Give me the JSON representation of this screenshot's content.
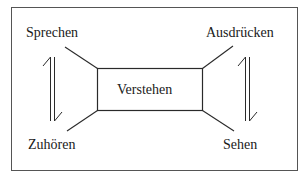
{
  "diagram": {
    "center": "Verstehen",
    "nodes": {
      "top_left": "Sprechen",
      "top_right": "Ausdrücken",
      "bottom_left": "Zuhören",
      "bottom_right": "Sehen"
    },
    "arrows": [
      {
        "between": [
          "Sprechen",
          "Zuhören"
        ],
        "style": "harpoon-pair"
      },
      {
        "between": [
          "Ausdrücken",
          "Sehen"
        ],
        "style": "harpoon-pair"
      }
    ],
    "colors": {
      "line": "#2a2a2a",
      "frame": "#555555",
      "background": "#ffffff"
    }
  }
}
